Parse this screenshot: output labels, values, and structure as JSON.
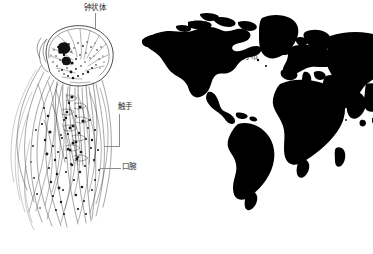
{
  "figure": {
    "background_color": "#ffffff",
    "ink_color": "#1a1a1a",
    "leader_color": "#8c8c8c",
    "width": 373,
    "height": 254
  },
  "jellyfish": {
    "panel_name": "jellyfish-illustration",
    "description_type": "line-drawing",
    "labels": [
      {
        "id": "bell",
        "text": "钟状体",
        "x": 84,
        "y": 3,
        "leader": {
          "type": "vertical",
          "x": 95,
          "y1": 13,
          "y2": 29
        }
      },
      {
        "id": "tentacles",
        "text": "触手",
        "x": 118,
        "y": 102,
        "leader": {
          "type": "elbow",
          "x": 119,
          "y1": 114,
          "y2": 147,
          "x2": 104
        }
      },
      {
        "id": "oral-arms",
        "text": "口腕",
        "x": 122,
        "y": 162,
        "leader": {
          "type": "horizontal",
          "x1": 100,
          "x2": 121,
          "y": 168
        }
      }
    ]
  },
  "map": {
    "panel_name": "distribution-map",
    "title": "分布",
    "title_x": 242,
    "title_y": 54,
    "fill_color": "#000000",
    "projection_note": "world-silhouette"
  }
}
